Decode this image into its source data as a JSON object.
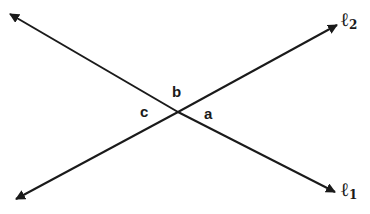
{
  "diagram": {
    "lines": [
      {
        "id": "l1",
        "label": "ℓ",
        "subscript": "1",
        "from": [
          10,
          14
        ],
        "to": [
          335,
          192
        ]
      },
      {
        "id": "l2",
        "label": "ℓ",
        "subscript": "2",
        "from": [
          16,
          199
        ],
        "to": [
          337,
          25
        ]
      }
    ],
    "intersection": [
      178,
      112
    ],
    "angles": [
      {
        "id": "a",
        "label": "a"
      },
      {
        "id": "b",
        "label": "b"
      },
      {
        "id": "c",
        "label": "c"
      }
    ],
    "stroke_color": "#1a1a1a"
  }
}
